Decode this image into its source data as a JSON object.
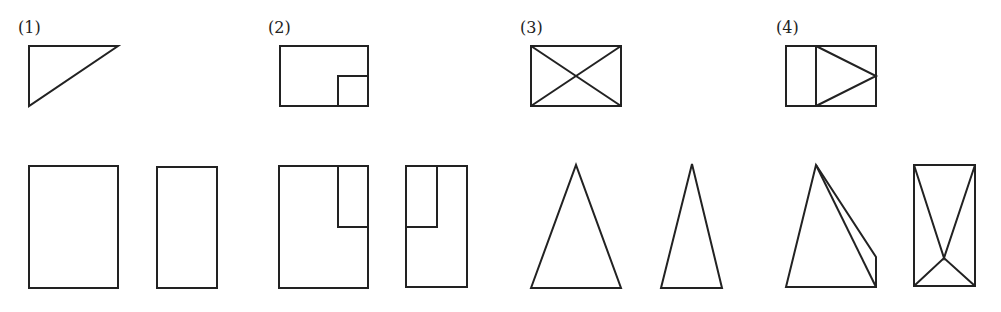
{
  "figures": [
    {
      "label": "(1)",
      "label_pos": [
        18,
        20
      ]
    },
    {
      "label": "(2)",
      "label_pos": [
        268,
        20
      ]
    },
    {
      "label": "(3)",
      "label_pos": [
        520,
        20
      ]
    },
    {
      "label": "(4)",
      "label_pos": [
        776,
        20
      ]
    }
  ],
  "colors": {
    "stroke": "#222222",
    "background": "#ffffff"
  },
  "shapes": {
    "fig1_top": {
      "type": "polygon",
      "points": "29,46 118,46 29,106"
    },
    "fig1_front": {
      "type": "rect",
      "x": 29,
      "y": 166,
      "w": 89,
      "h": 122
    },
    "fig1_side": {
      "type": "rect",
      "x": 157,
      "y": 167,
      "w": 60,
      "h": 121
    },
    "fig2_top_outer": {
      "type": "rect",
      "x": 280,
      "y": 46,
      "w": 88,
      "h": 60
    },
    "fig2_top_inner": {
      "type": "polyline",
      "points": "338,106 338,76 368,76"
    },
    "fig2_front_outer": {
      "type": "rect",
      "x": 279,
      "y": 166,
      "w": 89,
      "h": 122
    },
    "fig2_front_inner": {
      "type": "polyline",
      "points": "338,166 338,227 368,227"
    },
    "fig2_side_outer": {
      "type": "rect",
      "x": 406,
      "y": 166,
      "w": 61,
      "h": 121
    },
    "fig2_side_inner": {
      "type": "polyline",
      "points": "406,227 437,227 437,166"
    },
    "fig3_top_rect": {
      "type": "rect",
      "x": 531,
      "y": 46,
      "w": 90,
      "h": 60
    },
    "fig3_top_diag1": {
      "type": "line",
      "points": "531,46 621,106"
    },
    "fig3_top_diag2": {
      "type": "line",
      "points": "621,46 531,106"
    },
    "fig3_front": {
      "type": "polygon",
      "points": "531,288 576,165 621,288"
    },
    "fig3_side": {
      "type": "polygon",
      "points": "661,288 692,164 722,288"
    },
    "fig4_top_rect": {
      "type": "rect",
      "x": 786,
      "y": 46,
      "w": 90,
      "h": 60
    },
    "fig4_top_divider": {
      "type": "line",
      "points": "816,46 816,106"
    },
    "fig4_top_triangle": {
      "type": "polyline",
      "points": "816,46 876,76 816,106"
    },
    "fig4_front_outline": {
      "type": "polygon",
      "points": "786,287 816,165 876,257 876,287"
    },
    "fig4_front_edge": {
      "type": "line",
      "points": "816,165 876,287"
    },
    "fig4_side_rect": {
      "type": "rect",
      "x": 914,
      "y": 165,
      "w": 61,
      "h": 121
    },
    "fig4_side_lines": {
      "type": "polyline",
      "points": "914,165 944,258 975,165"
    },
    "fig4_side_lines2": {
      "type": "polyline",
      "points": "914,286 944,258 975,286"
    }
  }
}
